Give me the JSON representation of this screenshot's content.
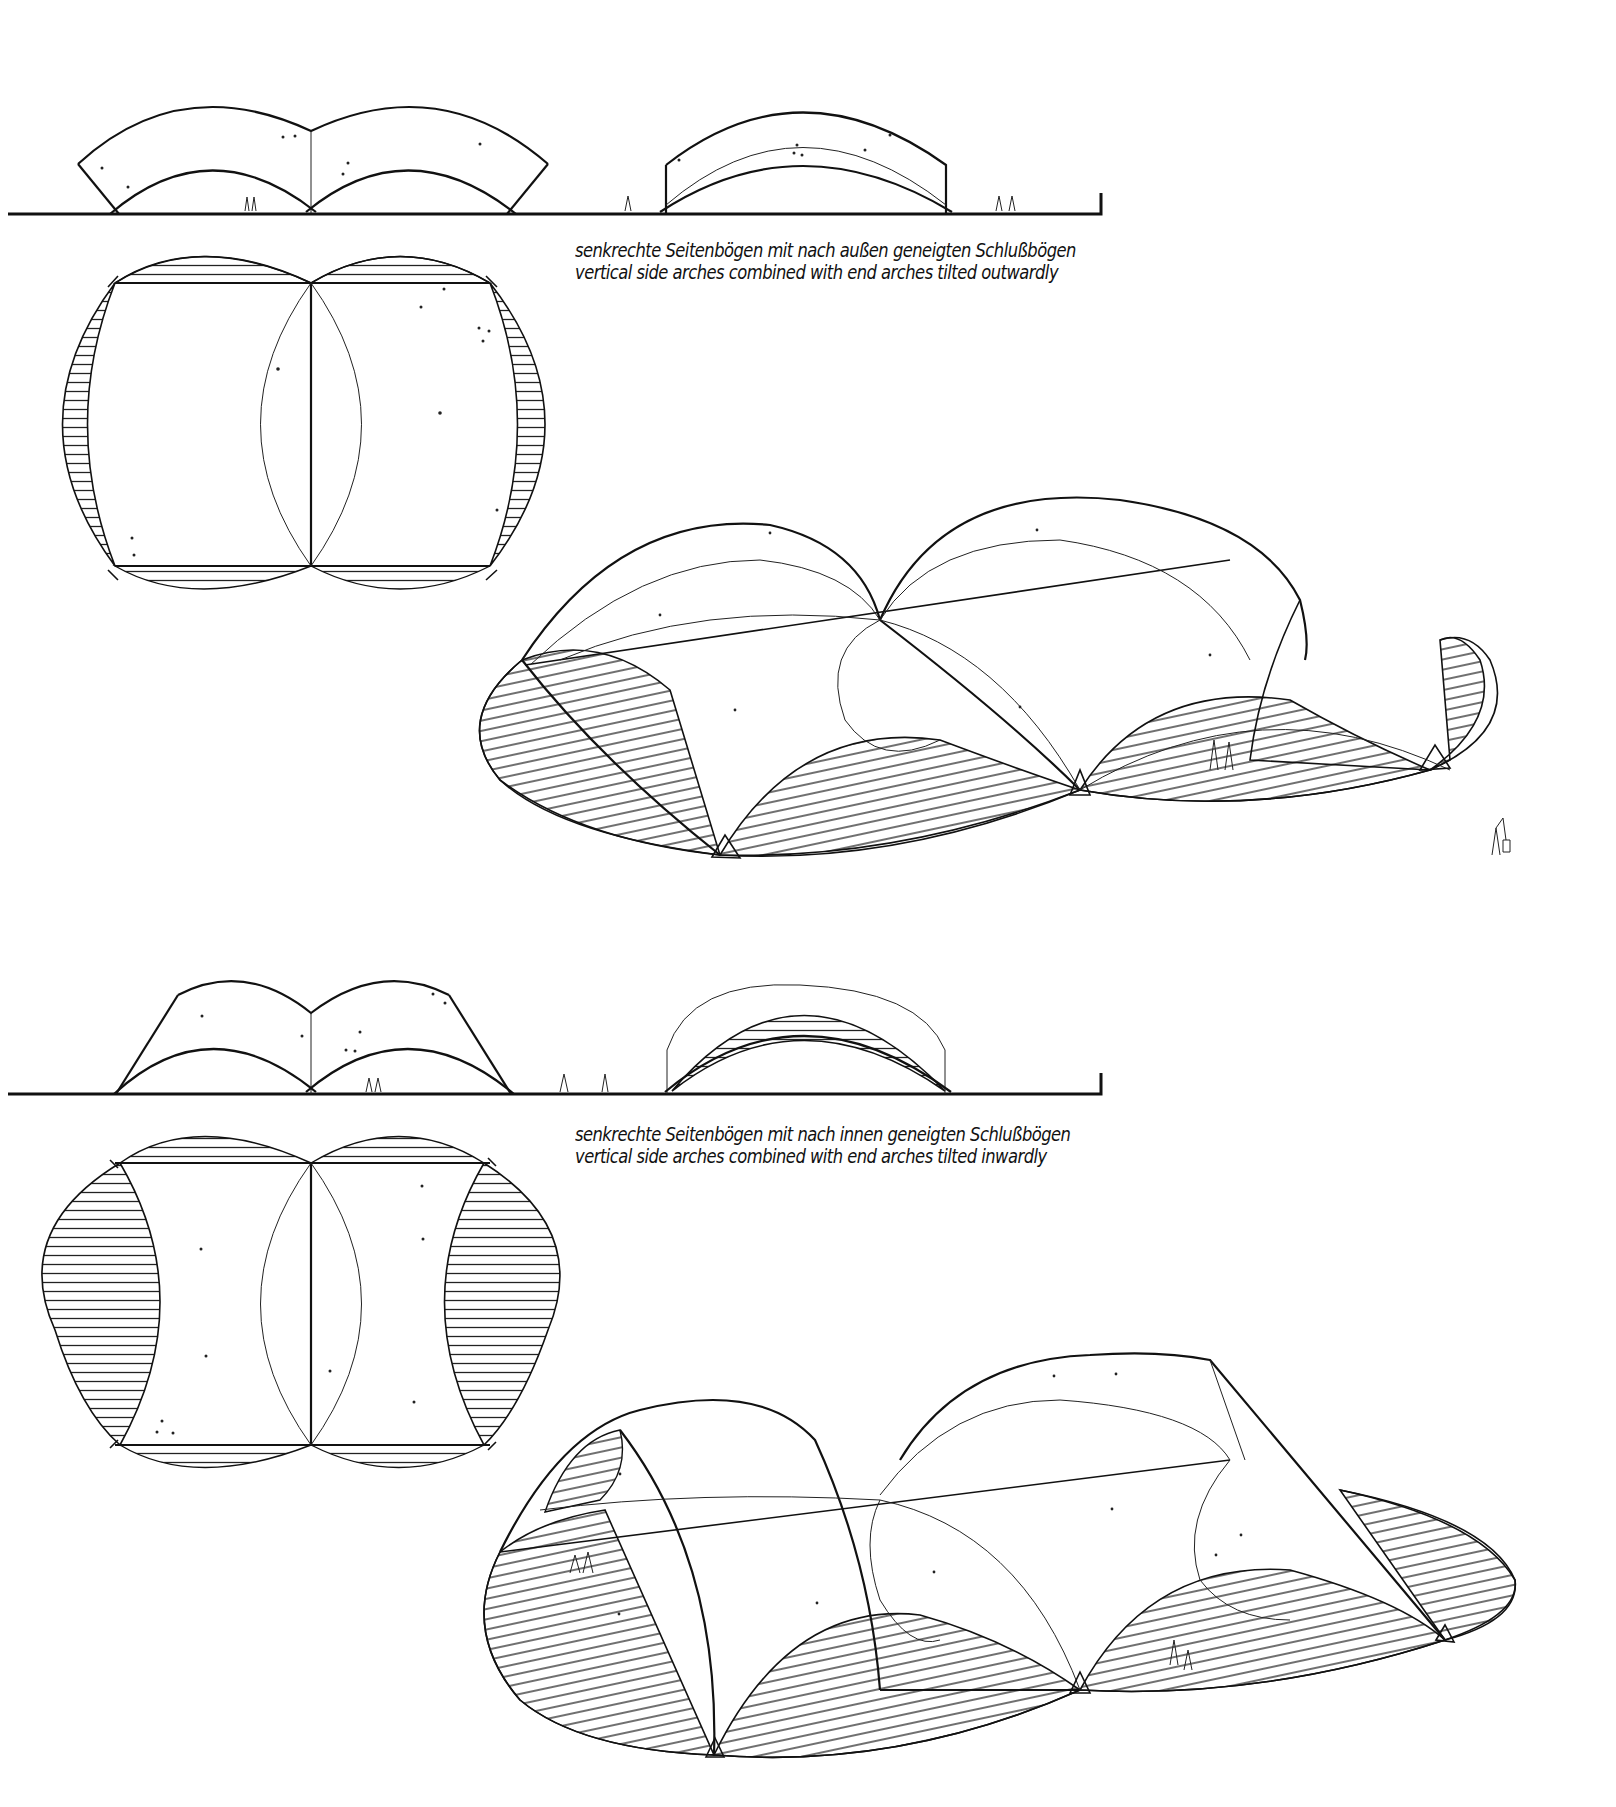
{
  "page": {
    "background": "#ffffff",
    "ink_color": "#111111",
    "hatch_color": "#222222"
  },
  "variants": [
    {
      "id": "outward",
      "caption": {
        "german": "senkrechte Seitenbögen mit nach außen geneigten Schlußbögen",
        "english": "vertical side arches combined with end arches tilted outwardly"
      },
      "views": [
        "side-elevation",
        "end-elevation",
        "plan",
        "perspective"
      ]
    },
    {
      "id": "inward",
      "caption": {
        "german": "senkrechte Seitenbögen mit nach innen geneigten Schlußbögen",
        "english": "vertical side arches combined with end arches tilted inwardly"
      },
      "views": [
        "side-elevation",
        "end-elevation",
        "plan",
        "perspective"
      ]
    }
  ]
}
